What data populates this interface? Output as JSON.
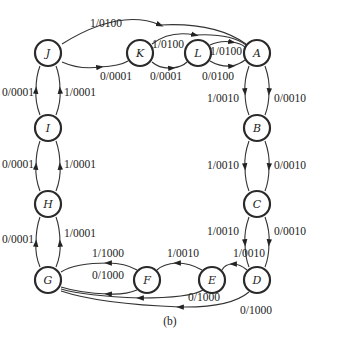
{
  "caption": "(b)",
  "nodes": [
    {
      "id": "J",
      "label": "J",
      "x": 48,
      "y": 53
    },
    {
      "id": "K",
      "label": "K",
      "x": 140,
      "y": 53
    },
    {
      "id": "L",
      "label": "L",
      "x": 198,
      "y": 53
    },
    {
      "id": "A",
      "label": "A",
      "x": 257,
      "y": 53
    },
    {
      "id": "B",
      "label": "B",
      "x": 257,
      "y": 128
    },
    {
      "id": "C",
      "label": "C",
      "x": 257,
      "y": 204
    },
    {
      "id": "D",
      "label": "D",
      "x": 257,
      "y": 280
    },
    {
      "id": "E",
      "label": "E",
      "x": 212,
      "y": 280
    },
    {
      "id": "F",
      "label": "F",
      "x": 147,
      "y": 280
    },
    {
      "id": "G",
      "label": "G",
      "x": 48,
      "y": 280
    },
    {
      "id": "H",
      "label": "H",
      "x": 48,
      "y": 204
    },
    {
      "id": "I",
      "label": "I",
      "x": 48,
      "y": 128
    }
  ],
  "edges": [
    {
      "from": "J",
      "to": "A",
      "label": "1/0100"
    },
    {
      "from": "J",
      "to": "K",
      "label": "0/0001"
    },
    {
      "from": "K",
      "to": "A",
      "label": "1/0100"
    },
    {
      "from": "K",
      "to": "L",
      "label": "0/0001"
    },
    {
      "from": "L",
      "to": "A",
      "label": "1/0100"
    },
    {
      "from": "L",
      "to": "A",
      "label": "0/0100"
    },
    {
      "from": "A",
      "to": "B",
      "label": "1/0010"
    },
    {
      "from": "A",
      "to": "B",
      "label": "0/0010"
    },
    {
      "from": "B",
      "to": "C",
      "label": "1/0010"
    },
    {
      "from": "B",
      "to": "C",
      "label": "0/0010"
    },
    {
      "from": "C",
      "to": "D",
      "label": "1/0010"
    },
    {
      "from": "C",
      "to": "D",
      "label": "0/0010"
    },
    {
      "from": "D",
      "to": "E",
      "label": "1/0010"
    },
    {
      "from": "D",
      "to": "G",
      "label": "0/1000"
    },
    {
      "from": "E",
      "to": "F",
      "label": "1/0010"
    },
    {
      "from": "E",
      "to": "G",
      "label": "0/1000"
    },
    {
      "from": "F",
      "to": "G",
      "label": "1/1000"
    },
    {
      "from": "F",
      "to": "G",
      "label": "0/1000"
    },
    {
      "from": "G",
      "to": "H",
      "label": "0/0001"
    },
    {
      "from": "G",
      "to": "H",
      "label": "1/0001"
    },
    {
      "from": "H",
      "to": "I",
      "label": "0/0001"
    },
    {
      "from": "H",
      "to": "I",
      "label": "1/0001"
    },
    {
      "from": "I",
      "to": "J",
      "label": "0/0001"
    },
    {
      "from": "I",
      "to": "J",
      "label": "1/0001"
    }
  ],
  "labels": {
    "JA": "1/0100",
    "JK": "0/0001",
    "KA": "1/0100",
    "KL": "0/0001",
    "LA1": "1/0100",
    "LA0": "0/0100",
    "AB1": "1/0010",
    "AB0": "0/0010",
    "BC1": "1/0010",
    "BC0": "0/0010",
    "CD1": "1/0010",
    "CD0": "0/0010",
    "DE1": "1/0010",
    "DG0": "0/1000",
    "EF1": "1/0010",
    "EG0": "0/1000",
    "FG1": "1/1000",
    "FG0": "0/1000",
    "GH0": "0/0001",
    "GH1": "1/0001",
    "HI0": "0/0001",
    "HI1": "1/0001",
    "IJ0": "0/0001",
    "IJ1": "1/0001"
  },
  "colors": {
    "stroke": "#2a2a2a",
    "text": "#222222",
    "background": "#ffffff"
  }
}
